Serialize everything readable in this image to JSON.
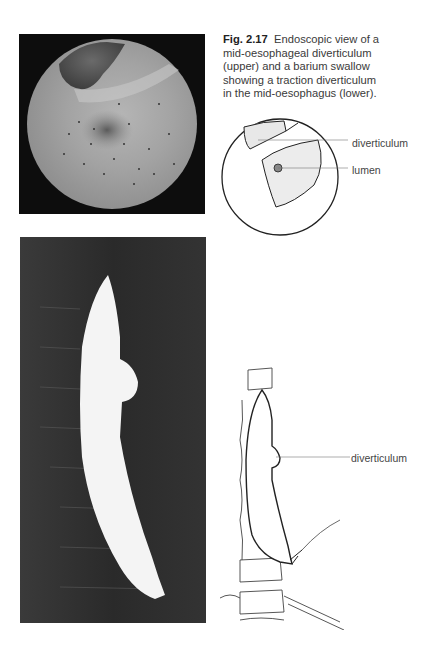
{
  "figure": {
    "number": "Fig. 2.17",
    "caption": "Endoscopic view of a mid-oesophageal diverticulum (upper) and a barium swallow showing a traction diverticulum in the mid-oesophagus (lower).",
    "caption_lines": [
      "Endoscopic view of a",
      "mid-oesophageal diverticulum",
      "(upper) and a barium swallow",
      "showing a traction diverticulum",
      "in the mid-oesophagus (lower)."
    ]
  },
  "upper_diagram": {
    "labels": [
      "diverticulum",
      "lumen"
    ]
  },
  "lower_diagram": {
    "labels": [
      "diverticulum"
    ]
  },
  "images": {
    "upper": "endoscopic-photo",
    "lower": "barium-swallow-xray"
  }
}
